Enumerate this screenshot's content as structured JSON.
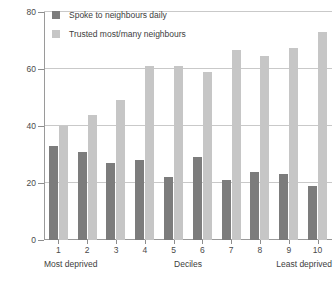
{
  "chart_data": {
    "type": "bar",
    "title": "",
    "subtitle": "",
    "xlabel": "Deciles",
    "ylabel": "",
    "ylim": [
      0,
      80
    ],
    "yticks": [
      0,
      20,
      40,
      60,
      80
    ],
    "grid": true,
    "legend_position": "top-left",
    "categories": [
      "1",
      "2",
      "3",
      "4",
      "5",
      "6",
      "7",
      "8",
      "9",
      "10"
    ],
    "series": [
      {
        "name": "Spoke to neighbours daily",
        "color": "#7c7c7c",
        "values": [
          33,
          31,
          27,
          28,
          22,
          29,
          21,
          24,
          23,
          19
        ]
      },
      {
        "name": "Trusted most/many neighbours",
        "color": "#c6c6c6",
        "values": [
          40,
          44,
          49,
          61,
          61,
          59,
          66.5,
          64.5,
          67.5,
          73
        ]
      }
    ],
    "annotations": {
      "axis_start_label": "Most deprived",
      "axis_middle_label": "Deciles",
      "axis_end_label": "Least deprived"
    }
  },
  "axis": {
    "y_ticks": [
      "0",
      "20",
      "40",
      "60",
      "80"
    ],
    "x_ticks": [
      "1",
      "2",
      "3",
      "4",
      "5",
      "6",
      "7",
      "8",
      "9",
      "10"
    ],
    "most_deprived": "Most deprived",
    "deciles": "Deciles",
    "least_deprived": "Least deprived"
  },
  "legend": {
    "items": [
      {
        "label": "Spoke to neighbours daily",
        "color": "#7c7c7c"
      },
      {
        "label": "Trusted most/many neighbours",
        "color": "#c6c6c6"
      }
    ]
  },
  "colors": {
    "series_dark": "#7c7c7c",
    "series_light": "#c6c6c6",
    "gridline": "#c9c9c9",
    "axis": "#9a9a9a",
    "text": "#3d3d3d",
    "background": "#ffffff"
  }
}
